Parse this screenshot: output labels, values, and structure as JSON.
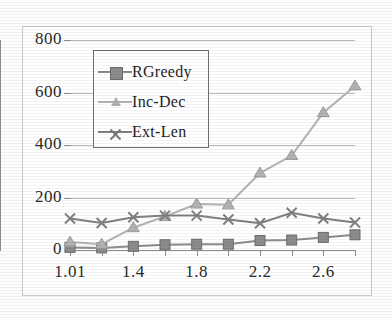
{
  "chart_data": {
    "type": "line",
    "title": "",
    "xlabel": "",
    "ylabel": "",
    "x": [
      1.01,
      1.2,
      1.4,
      1.6,
      1.8,
      2.0,
      2.2,
      2.4,
      2.6,
      2.8
    ],
    "xtick_labels": [
      "1.01",
      "",
      "1.4",
      "",
      "1.8",
      "",
      "2.2",
      "",
      "2.6",
      ""
    ],
    "xlim": [
      1.01,
      2.8
    ],
    "ylim": [
      0,
      800
    ],
    "yticks": [
      0,
      200,
      400,
      600,
      800
    ],
    "ytick_labels": [
      "0",
      "200",
      "400",
      "600",
      "800"
    ],
    "grid": true,
    "legend_position": "upper-left-inside",
    "series": [
      {
        "name": "RGreedy",
        "marker": "square",
        "color": "#8c8c8c",
        "values": [
          10,
          8,
          14,
          20,
          22,
          22,
          36,
          38,
          48,
          58
        ]
      },
      {
        "name": "Inc-Dec",
        "marker": "triangle",
        "color": "#b3b3b3",
        "values": [
          30,
          22,
          85,
          128,
          175,
          172,
          293,
          360,
          523,
          625
        ]
      },
      {
        "name": "Ext-Len",
        "marker": "x",
        "color": "#808080",
        "values": [
          120,
          103,
          125,
          131,
          131,
          116,
          102,
          142,
          120,
          105
        ]
      }
    ]
  },
  "legend": {
    "items": [
      {
        "label": "RGreedy"
      },
      {
        "label": "Inc-Dec"
      },
      {
        "label": "Ext-Len"
      }
    ]
  }
}
